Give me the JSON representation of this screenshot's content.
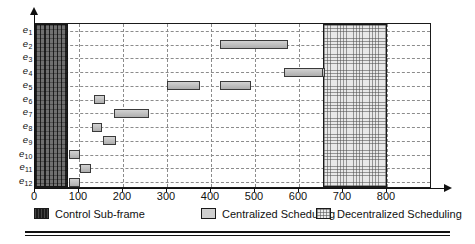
{
  "chart_data": {
    "type": "bar",
    "subtype": "gantt-timeline",
    "title": "",
    "xlabel": "",
    "ylabel": "",
    "xlim": [
      0,
      830
    ],
    "ylim_categories": 12,
    "grid": true,
    "legend_position": "bottom",
    "x_ticks": [
      0,
      100,
      200,
      300,
      400,
      500,
      600,
      700,
      800
    ],
    "x_tick_labels": [
      "0",
      "100",
      "200",
      "300",
      "400",
      "500",
      "600",
      "700",
      "800"
    ],
    "categories": [
      "e1",
      "e2",
      "e3",
      "e4",
      "e5",
      "e6",
      "e7",
      "e8",
      "e9",
      "e10",
      "e11",
      "e12"
    ],
    "category_labels": [
      {
        "base": "e",
        "sub": "1"
      },
      {
        "base": "e",
        "sub": "2"
      },
      {
        "base": "e",
        "sub": "3"
      },
      {
        "base": "e",
        "sub": "4"
      },
      {
        "base": "e",
        "sub": "5"
      },
      {
        "base": "e",
        "sub": "6"
      },
      {
        "base": "e",
        "sub": "7"
      },
      {
        "base": "e",
        "sub": "8"
      },
      {
        "base": "e",
        "sub": "9"
      },
      {
        "base": "e",
        "sub": "10"
      },
      {
        "base": "e",
        "sub": "11"
      },
      {
        "base": "e",
        "sub": "12"
      }
    ],
    "regions": [
      {
        "name": "control-sub-frame",
        "start": 0,
        "end": 75,
        "series": "Control Sub-frame"
      },
      {
        "name": "decentralized-window",
        "start": 655,
        "end": 800,
        "series": "Decentralized Scheduling"
      }
    ],
    "series": [
      {
        "name": "Centralized Scheduling",
        "color": "#c2c2c2",
        "bars": [
          {
            "category": "e2",
            "row": 2,
            "start": 420,
            "end": 575
          },
          {
            "category": "e4",
            "row": 4,
            "start": 645,
            "end": 660
          },
          {
            "category": "e5",
            "row": 5,
            "start": 420,
            "end": 490
          },
          {
            "category": "e5b",
            "row": 5,
            "start": 300,
            "end": 375
          },
          {
            "category": "e6",
            "row": 6,
            "start": 135,
            "end": 158
          },
          {
            "category": "e7",
            "row": 7,
            "start": 180,
            "end": 260
          },
          {
            "category": "e8",
            "row": 8,
            "start": 130,
            "end": 153
          },
          {
            "category": "e9",
            "row": 9,
            "start": 155,
            "end": 183
          },
          {
            "category": "e10",
            "row": 10,
            "start": 78,
            "end": 103
          },
          {
            "category": "e11",
            "row": 11,
            "start": 103,
            "end": 128
          },
          {
            "category": "e12",
            "row": 12,
            "start": 78,
            "end": 103
          },
          {
            "category": "e4r",
            "row": 4,
            "start": 565,
            "end": 655
          }
        ]
      }
    ]
  },
  "legend": {
    "items": [
      {
        "label": "Control Sub-frame",
        "swatch": "control-swatch"
      },
      {
        "label": "Centralized Scheduling",
        "swatch": "centralized-swatch"
      },
      {
        "label": "Decentralized Scheduling",
        "swatch": "decentralized-swatch"
      }
    ]
  },
  "colors": {
    "control_block": "#707070",
    "centralized_bar": "#c2c2c2",
    "decentralized_block": "#e8e8e8",
    "axis": "#111111",
    "grid": "#8c8c8c"
  }
}
